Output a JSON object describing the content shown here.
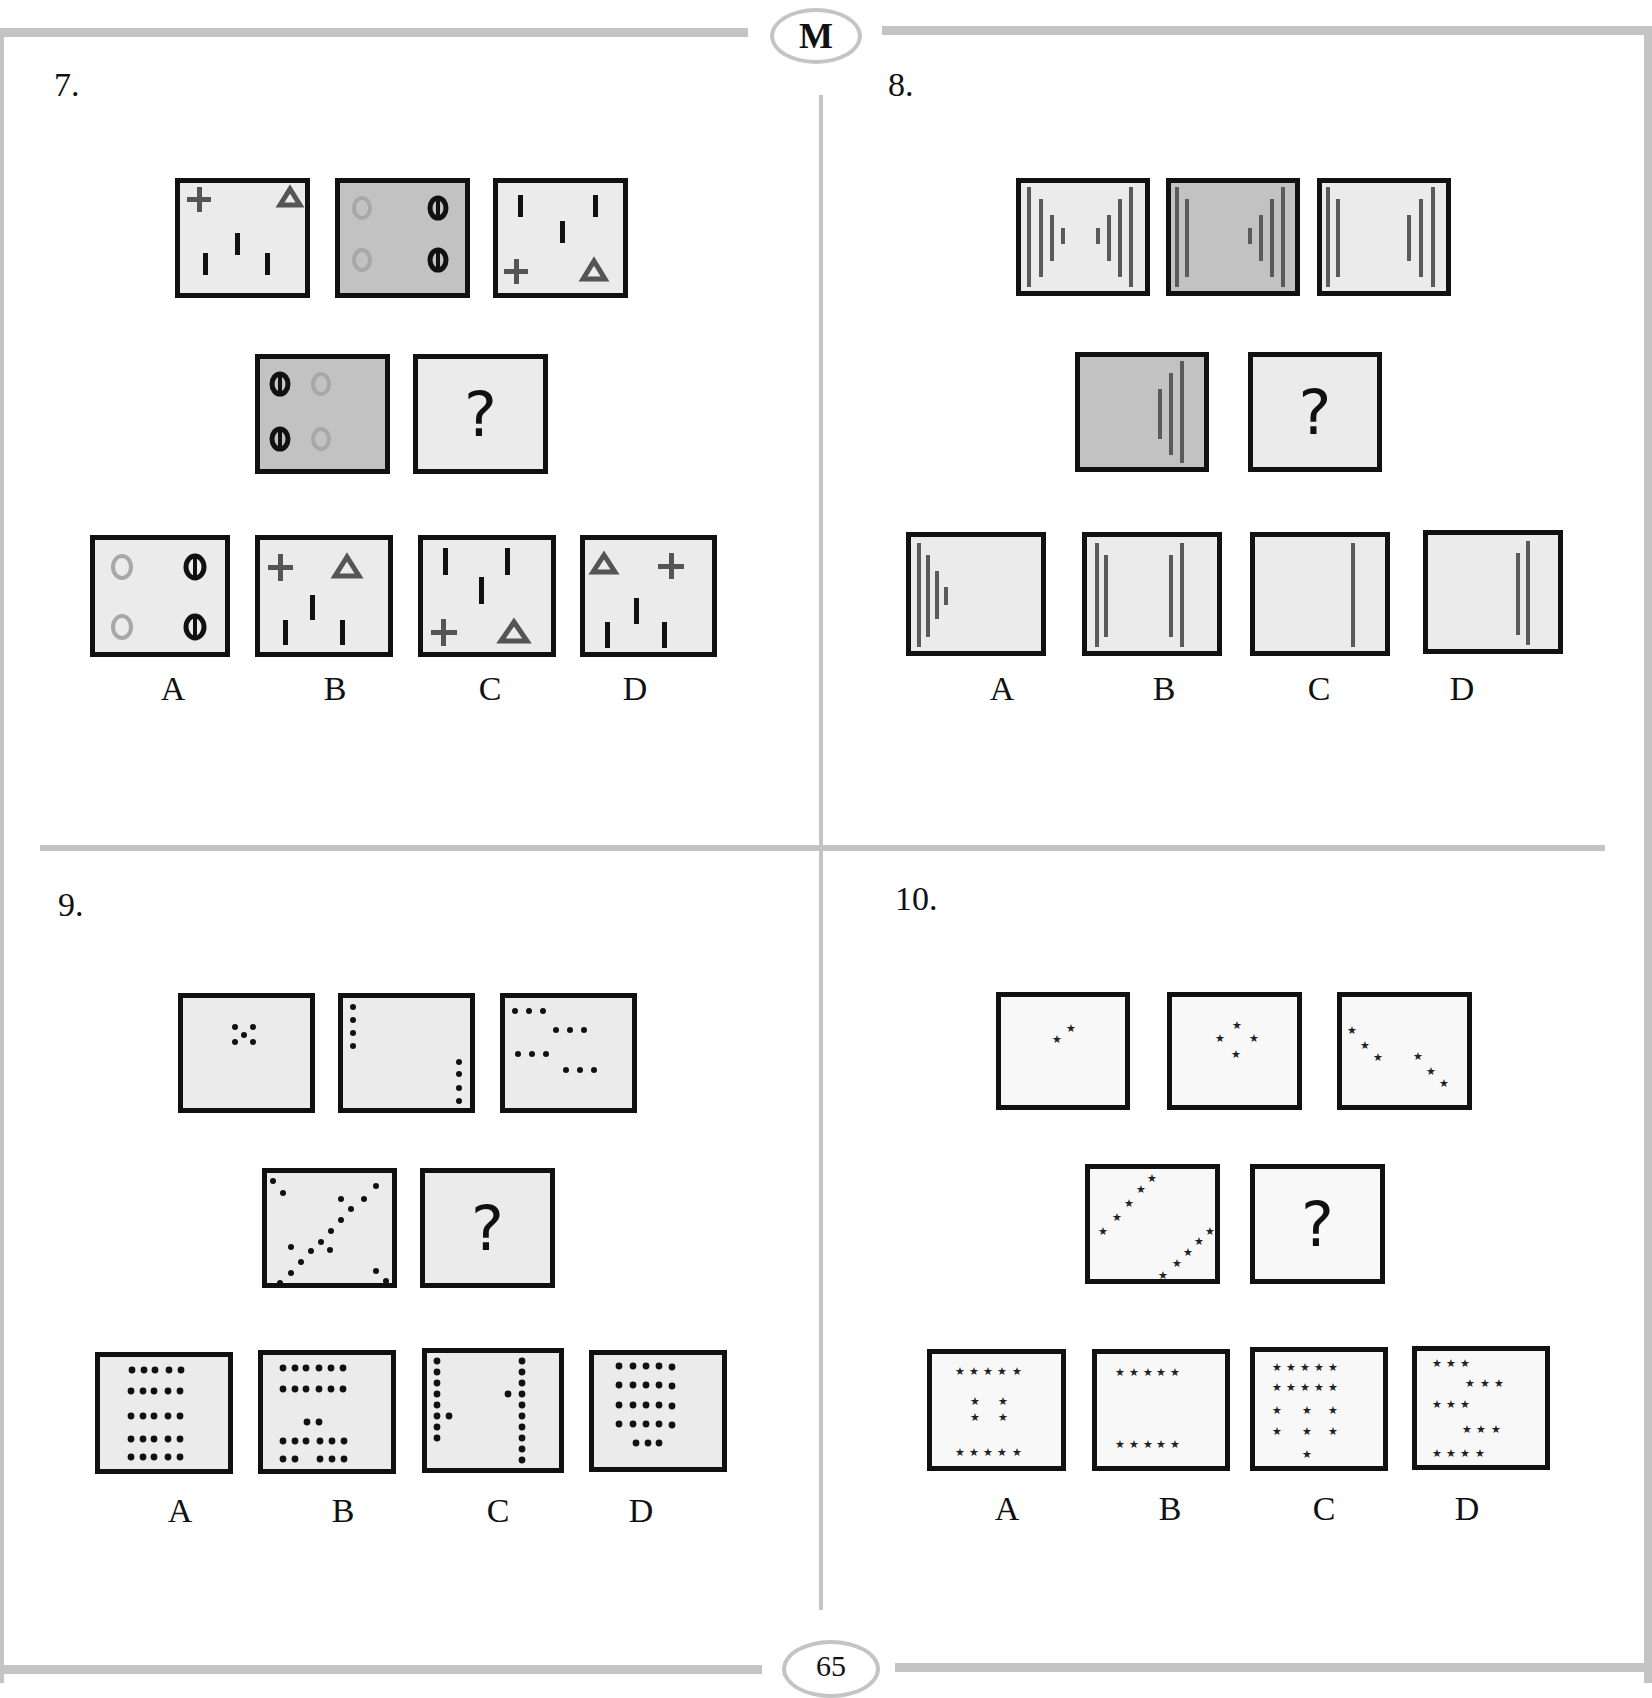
{
  "header": {
    "badge_letter": "M"
  },
  "footer": {
    "page_number": "65"
  },
  "colors": {
    "frame_rule": "#c4c4c4",
    "box_border": "#111111",
    "light_fill": "#ebebeb",
    "dark_fill": "#c2c2c2",
    "white_fill": "#f8f8f8",
    "mark_gray": "#555555",
    "ring_gray": "#a8a8a8"
  },
  "questions": [
    {
      "number": "7.",
      "description": "Quadrant pattern puzzle: crosses, triangles, vertical bars, circles and barred circles",
      "row1": [
        {
          "name": "q7-cell-1",
          "fill": "light",
          "shapes": [
            "plus top-left",
            "triangle top-right",
            "three bars bottom"
          ]
        },
        {
          "name": "q7-cell-2",
          "fill": "dark",
          "shapes": [
            "light circles left column",
            "barred circles right column"
          ]
        },
        {
          "name": "q7-cell-3",
          "fill": "light",
          "shapes": [
            "three bars top",
            "plus bottom-left",
            "triangle bottom-right"
          ]
        }
      ],
      "row2": [
        {
          "name": "q7-cell-4",
          "fill": "dark",
          "shapes": [
            "barred circles left column",
            "light circles right column"
          ]
        },
        {
          "name": "q7-cell-5",
          "fill": "light",
          "question_mark": "?"
        }
      ],
      "options": [
        {
          "label": "A",
          "shapes": [
            "light circles left",
            "barred circles right"
          ]
        },
        {
          "label": "B",
          "shapes": [
            "plus top-left",
            "triangle top-right",
            "three bars bottom"
          ]
        },
        {
          "label": "C",
          "shapes": [
            "three bars top",
            "plus bottom-left",
            "triangle bottom-right"
          ]
        },
        {
          "label": "D",
          "shapes": [
            "triangle top-left",
            "plus top-right",
            "three bars bottom"
          ]
        }
      ]
    },
    {
      "number": "8.",
      "description": "Nested vertical line puzzle",
      "row1": [
        {
          "name": "q8-cell-1",
          "fill": "light",
          "shapes": [
            "4 left lines decreasing",
            "4 right lines decreasing"
          ]
        },
        {
          "name": "q8-cell-2",
          "fill": "dark",
          "shapes": [
            "2 left lines",
            "4 right lines"
          ]
        },
        {
          "name": "q8-cell-3",
          "fill": "light",
          "shapes": [
            "2 left lines",
            "3 right lines"
          ]
        }
      ],
      "row2": [
        {
          "name": "q8-cell-4",
          "fill": "dark",
          "shapes": [
            "3 right lines"
          ]
        },
        {
          "name": "q8-cell-5",
          "fill": "light",
          "question_mark": "?"
        }
      ],
      "options": [
        {
          "label": "A",
          "shapes": [
            "4 left lines decreasing"
          ]
        },
        {
          "label": "B",
          "shapes": [
            "2 left lines",
            "2 right lines"
          ]
        },
        {
          "label": "C",
          "shapes": [
            "1 right line"
          ]
        },
        {
          "label": "D",
          "shapes": [
            "2 right lines"
          ]
        }
      ]
    },
    {
      "number": "9.",
      "description": "Dot pattern puzzle",
      "row1": [
        {
          "name": "q9-cell-1",
          "fill": "light",
          "dots": 5
        },
        {
          "name": "q9-cell-2",
          "fill": "light",
          "dots": 8
        },
        {
          "name": "q9-cell-3",
          "fill": "light",
          "dots": 12
        },
        {
          "name": "q9-cell-4",
          "fill": "light",
          "dots": 18
        }
      ],
      "row2": [
        {
          "name": "q9-cell-5",
          "fill": "light",
          "question_mark": "?"
        }
      ],
      "options": [
        {
          "label": "A",
          "dots": 25
        },
        {
          "label": "B",
          "dots": 24
        },
        {
          "label": "C",
          "dots": 21
        },
        {
          "label": "D",
          "dots": 23
        }
      ]
    },
    {
      "number": "10.",
      "description": "Star pattern puzzle",
      "row1": [
        {
          "name": "q10-cell-1",
          "fill": "white",
          "stars": 2
        },
        {
          "name": "q10-cell-2",
          "fill": "white",
          "stars": 4
        },
        {
          "name": "q10-cell-3",
          "fill": "white",
          "stars": 6
        },
        {
          "name": "q10-cell-4",
          "fill": "white",
          "stars": 10
        }
      ],
      "row2": [
        {
          "name": "q10-cell-5",
          "fill": "white",
          "question_mark": "?"
        }
      ],
      "options": [
        {
          "label": "A",
          "stars": 14
        },
        {
          "label": "B",
          "stars": 10
        },
        {
          "label": "C",
          "stars": 17
        },
        {
          "label": "D",
          "stars": 16
        }
      ]
    }
  ]
}
